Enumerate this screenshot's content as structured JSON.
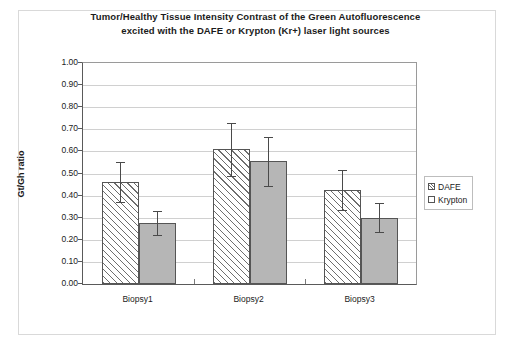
{
  "chart_data": {
    "type": "bar",
    "title": "Tumor/Healthy Tissue Intensity Contrast of the Green Autofluorescence excited with the DAFE or Krypton (Kr+) laser light sources",
    "title_lines": [
      "Tumor/Healthy Tissue Intensity Contrast of the Green Autofluorescence",
      "excited with the DAFE or Krypton (Kr+) laser light sources"
    ],
    "xlabel": "",
    "ylabel": "Gt/Gh ratio",
    "ylim": [
      0.0,
      1.0
    ],
    "ytick_step": 0.1,
    "ytick_labels": [
      "1.00",
      "0.90",
      "0.80",
      "0.70",
      "0.60",
      "0.50",
      "0.40",
      "0.30",
      "0.20",
      "0.10",
      "0.00"
    ],
    "ytick_values": [
      1.0,
      0.9,
      0.8,
      0.7,
      0.6,
      0.5,
      0.4,
      0.3,
      0.2,
      0.1,
      0.0
    ],
    "grid": true,
    "legend_position": "right",
    "categories": [
      "Biopsy1",
      "Biopsy2",
      "Biopsy3"
    ],
    "series": [
      {
        "name": "DAFE",
        "color": "#ffffff",
        "pattern": "diagonal-hatch",
        "values": [
          0.46,
          0.61,
          0.425
        ],
        "errors": [
          0.09,
          0.12,
          0.09
        ]
      },
      {
        "name": "Krypton",
        "color": "#b6b6b6",
        "pattern": "solid",
        "values": [
          0.275,
          0.555,
          0.3
        ],
        "errors": [
          0.055,
          0.11,
          0.065
        ]
      }
    ]
  },
  "legend": {
    "items": [
      {
        "label": "DAFE"
      },
      {
        "label": "Krypton"
      }
    ]
  },
  "colors": {
    "dafe_fill": "#ffffff",
    "dafe_hatch": "#6e6e6e",
    "krypton_fill": "#b6b6b6",
    "axis": "#5a5a5a",
    "grid": "#d0d0d0",
    "text": "#1b1b1b"
  }
}
